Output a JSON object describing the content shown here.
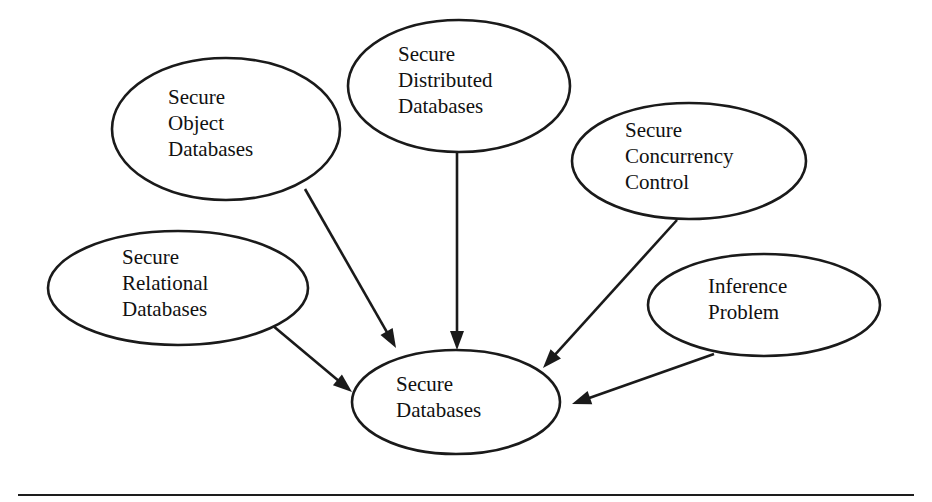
{
  "diagram": {
    "type": "concept-map",
    "title": "Secure Databases",
    "background_color": "#ffffff",
    "stroke_color": "#1a1a1a",
    "text_color": "#111111",
    "nodes": [
      {
        "id": "secure-object-databases",
        "lines": [
          "Secure",
          "Object",
          "Databases"
        ],
        "label": "Secure Object Databases",
        "cx": 226,
        "cy": 129,
        "rx": 114,
        "ry": 71,
        "text_x": 168,
        "text_y": 104
      },
      {
        "id": "secure-distributed-databases",
        "lines": [
          "Secure",
          "Distributed",
          "Databases"
        ],
        "label": "Secure Distributed Databases",
        "cx": 459,
        "cy": 86,
        "rx": 111,
        "ry": 66,
        "text_x": 398,
        "text_y": 61
      },
      {
        "id": "secure-concurrency-control",
        "lines": [
          "Secure",
          "Concurrency",
          "Control"
        ],
        "label": "Secure Concurrency Control",
        "cx": 689,
        "cy": 161,
        "rx": 117,
        "ry": 58,
        "text_x": 625,
        "text_y": 137
      },
      {
        "id": "secure-relational-databases",
        "lines": [
          "Secure",
          "Relational",
          "Databases"
        ],
        "label": "Secure Relational Databases",
        "cx": 178,
        "cy": 288,
        "rx": 130,
        "ry": 57,
        "text_x": 122,
        "text_y": 264
      },
      {
        "id": "inference-problem",
        "lines": [
          "Inference",
          "Problem"
        ],
        "label": "Inference Problem",
        "cx": 764,
        "cy": 305,
        "rx": 116,
        "ry": 51,
        "text_x": 708,
        "text_y": 293
      },
      {
        "id": "secure-databases",
        "lines": [
          "Secure",
          "Databases"
        ],
        "label": "Secure Databases",
        "cx": 456,
        "cy": 402,
        "rx": 104,
        "ry": 52,
        "text_x": 396,
        "text_y": 391
      }
    ],
    "edges": [
      {
        "id": "edge-object-to-secure",
        "from": "secure-object-databases",
        "to": "secure-databases",
        "label": "Secure Object Databases to Secure Databases",
        "x1": 305,
        "y1": 189,
        "x2": 396,
        "y2": 348
      },
      {
        "id": "edge-distributed-to-secure",
        "from": "secure-distributed-databases",
        "to": "secure-databases",
        "label": "Secure Distributed Databases to Secure Databases",
        "x1": 457,
        "y1": 151,
        "x2": 457,
        "y2": 350
      },
      {
        "id": "edge-concurrency-to-secure",
        "from": "secure-concurrency-control",
        "to": "secure-databases",
        "label": "Secure Concurrency Control to Secure Databases",
        "x1": 677,
        "y1": 220,
        "x2": 543,
        "y2": 368
      },
      {
        "id": "edge-relational-to-secure",
        "from": "secure-relational-databases",
        "to": "secure-databases",
        "label": "Secure Relational Databases to Secure Databases",
        "x1": 272,
        "y1": 325,
        "x2": 352,
        "y2": 392
      },
      {
        "id": "edge-inference-to-secure",
        "from": "inference-problem",
        "to": "secure-databases",
        "label": "Inference Problem to Secure Databases",
        "x1": 714,
        "y1": 354,
        "x2": 572,
        "y2": 404
      }
    ],
    "footer_rule": {
      "present": true,
      "y": 494
    }
  }
}
